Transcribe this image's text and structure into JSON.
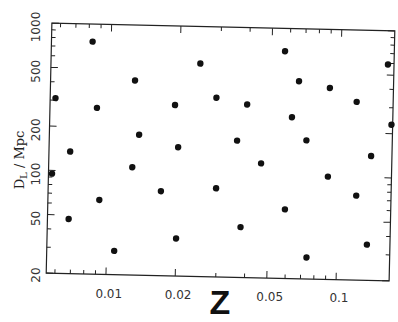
{
  "chart_data": {
    "type": "scatter",
    "title": "",
    "xlabel": "z",
    "ylabel": "D_L / Mpc",
    "xscale": "log",
    "yscale": "log",
    "xlim": [
      0.0055,
      0.17
    ],
    "ylim": [
      20,
      1000
    ],
    "grid": false,
    "legend": null,
    "x_ticks": [
      {
        "value": 0.01,
        "label": "0.01"
      },
      {
        "value": 0.02,
        "label": "0.02"
      },
      {
        "value": 0.05,
        "label": "0.05"
      },
      {
        "value": 0.1,
        "label": "0.1"
      }
    ],
    "y_ticks": [
      {
        "value": 20,
        "label": "20"
      },
      {
        "value": 50,
        "label": "50"
      },
      {
        "value": 100,
        "label": "100"
      },
      {
        "value": 200,
        "label": "200"
      },
      {
        "value": 500,
        "label": "500"
      },
      {
        "value": 1000,
        "label": "1000"
      }
    ],
    "series": [
      {
        "name": "points",
        "marker": "filled-circle",
        "color": "#111111",
        "points": [
          {
            "x": 0.0058,
            "y": 310
          },
          {
            "x": 0.0083,
            "y": 760
          },
          {
            "x": 0.0088,
            "y": 270
          },
          {
            "x": 0.0128,
            "y": 420
          },
          {
            "x": 0.0245,
            "y": 560
          },
          {
            "x": 0.0192,
            "y": 290
          },
          {
            "x": 0.029,
            "y": 330
          },
          {
            "x": 0.0395,
            "y": 300
          },
          {
            "x": 0.057,
            "y": 700
          },
          {
            "x": 0.066,
            "y": 440
          },
          {
            "x": 0.09,
            "y": 400
          },
          {
            "x": 0.118,
            "y": 325
          },
          {
            "x": 0.16,
            "y": 590
          },
          {
            "x": 0.062,
            "y": 250
          },
          {
            "x": 0.0135,
            "y": 180
          },
          {
            "x": 0.02,
            "y": 150
          },
          {
            "x": 0.036,
            "y": 170
          },
          {
            "x": 0.072,
            "y": 175
          },
          {
            "x": 0.168,
            "y": 230
          },
          {
            "x": 0.0068,
            "y": 135
          },
          {
            "x": 0.046,
            "y": 120
          },
          {
            "x": 0.138,
            "y": 140
          },
          {
            "x": 0.0057,
            "y": 95
          },
          {
            "x": 0.0127,
            "y": 108
          },
          {
            "x": 0.0295,
            "y": 80
          },
          {
            "x": 0.017,
            "y": 75
          },
          {
            "x": 0.09,
            "y": 100
          },
          {
            "x": 0.0092,
            "y": 64
          },
          {
            "x": 0.059,
            "y": 59
          },
          {
            "x": 0.12,
            "y": 75
          },
          {
            "x": 0.0068,
            "y": 47
          },
          {
            "x": 0.038,
            "y": 44
          },
          {
            "x": 0.02,
            "y": 36
          },
          {
            "x": 0.0108,
            "y": 29
          },
          {
            "x": 0.074,
            "y": 28
          },
          {
            "x": 0.135,
            "y": 35
          }
        ]
      }
    ],
    "frame": {
      "corners_px": {
        "tl": [
          52,
          25
        ],
        "tr": [
          393,
          33
        ],
        "br": [
          390,
          281
        ],
        "bl": [
          46,
          275
        ]
      },
      "note": "plot frame slightly rotated (scanned figure)"
    }
  }
}
